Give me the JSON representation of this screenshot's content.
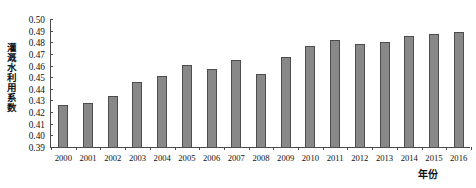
{
  "chart_data": {
    "type": "bar",
    "title": "",
    "subtitle": "",
    "xlabel": "年份",
    "ylabel": "灌溉水利用系数",
    "categories": [
      "2000",
      "2001",
      "2002",
      "2003",
      "2004",
      "2005",
      "2006",
      "2007",
      "2008",
      "2009",
      "2010",
      "2011",
      "2012",
      "2013",
      "2014",
      "2015",
      "2016"
    ],
    "values": [
      0.427,
      0.429,
      0.435,
      0.447,
      0.452,
      0.461,
      0.458,
      0.466,
      0.454,
      0.468,
      0.478,
      0.483,
      0.479,
      0.481,
      0.486,
      0.488,
      0.49
    ],
    "series": [
      {
        "name": "灌溉水利用系数",
        "values": [
          0.427,
          0.429,
          0.435,
          0.447,
          0.452,
          0.461,
          0.458,
          0.466,
          0.454,
          0.468,
          0.478,
          0.483,
          0.479,
          0.481,
          0.486,
          0.488,
          0.49
        ]
      }
    ],
    "ylim": [
      0.39,
      0.5
    ],
    "xlim_categories": 17,
    "ytick_labels": [
      "0.50",
      "0.49",
      "0.48",
      "0.47",
      "0.46",
      "0.45",
      "0.44",
      "0.43",
      "0.42",
      "0.41",
      "0.40",
      "0.39"
    ],
    "ytick_values": [
      0.5,
      0.49,
      0.48,
      0.47,
      0.46,
      0.45,
      0.44,
      0.43,
      0.42,
      0.41,
      0.4,
      0.39
    ],
    "grid": false,
    "legend": false,
    "legend_position": "none",
    "bar_color": "#888888",
    "bar_edge_color": "#4d4d4d",
    "axis_color": "#4a4a4a",
    "background_color": "#ffffff"
  }
}
